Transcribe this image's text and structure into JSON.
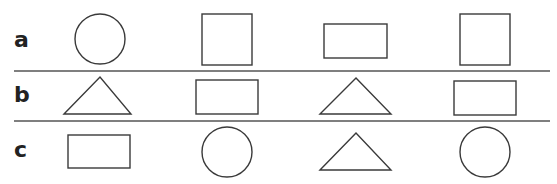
{
  "rows": [
    {
      "label": "a",
      "shapes": [
        "circle",
        "square",
        "rectangle",
        "square"
      ]
    },
    {
      "label": "b",
      "shapes": [
        "triangle",
        "rectangle",
        "triangle",
        "rectangle"
      ]
    },
    {
      "label": "c",
      "shapes": [
        "rectangle",
        "circle",
        "triangle",
        "circle"
      ]
    }
  ],
  "colors": {
    "stroke": "#3a3a3a",
    "divider": "#555555",
    "label": "#222222"
  }
}
